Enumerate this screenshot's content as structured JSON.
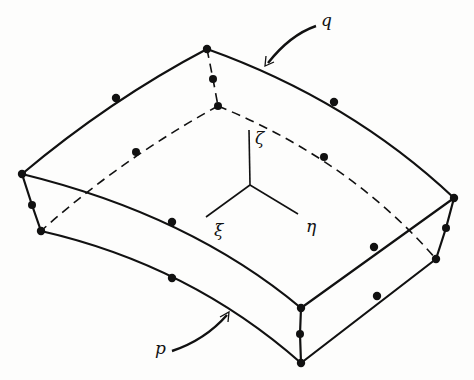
{
  "figure": {
    "labels": {
      "q": "q",
      "p": "p",
      "xi": "ξ",
      "eta": "η",
      "zeta": "ζ"
    },
    "colors": {
      "ink": "#111111",
      "background": "#fdfdfc"
    },
    "nodes": [
      [
        207,
        49
      ],
      [
        213,
        79
      ],
      [
        218,
        106
      ],
      [
        116,
        98
      ],
      [
        334,
        102
      ],
      [
        22,
        174
      ],
      [
        32,
        205
      ],
      [
        41,
        231
      ],
      [
        454,
        198
      ],
      [
        446,
        228
      ],
      [
        436,
        259
      ],
      [
        301,
        308
      ],
      [
        300,
        334
      ],
      [
        301,
        363
      ],
      [
        172,
        222
      ],
      [
        374,
        247
      ],
      [
        172,
        278
      ],
      [
        377,
        296
      ],
      [
        107,
        172
      ],
      [
        324,
        157
      ]
    ]
  }
}
